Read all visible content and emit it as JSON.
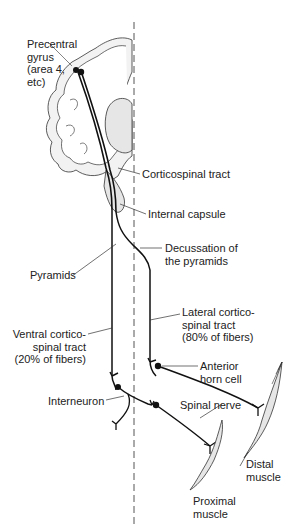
{
  "diagram": {
    "colors": {
      "line": "#1a1a1a",
      "fill": "#e6e6e6",
      "midline": "#555555",
      "background": "#ffffff"
    },
    "labels": {
      "precentral_gyrus": [
        "Precentral",
        "gyrus",
        "(area 4,",
        "etc)"
      ],
      "corticospinal_tract": "Corticospinal tract",
      "internal_capsule": "Internal capsule",
      "decussation": [
        "Decussation of",
        "the pyramids"
      ],
      "pyramids": "Pyramids",
      "lateral_tract": [
        "Lateral cortico-",
        "spinal tract",
        "(80% of fibers)"
      ],
      "anterior_horn_cell": [
        "Anterior",
        "horn cell"
      ],
      "ventral_tract": [
        "Ventral cortico-",
        "spinal tract",
        "(20% of fibers)"
      ],
      "interneuron": "Interneuron",
      "spinal_nerve": "Spinal nerve",
      "distal_muscle": [
        "Distal",
        "muscle"
      ],
      "proximal_muscle": [
        "Proximal",
        "muscle"
      ]
    }
  }
}
